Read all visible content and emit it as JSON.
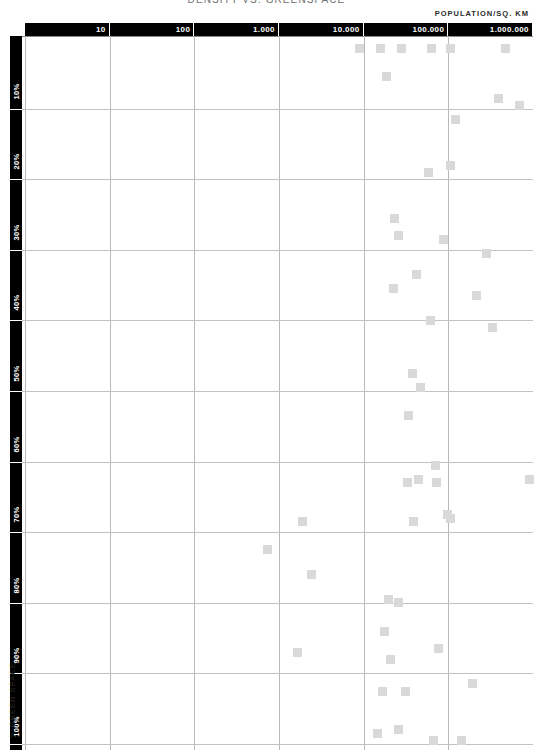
{
  "title": "DENSITY VS. GREENSPACE",
  "x_axis": {
    "caption": "POPULATION/SQ. KM",
    "ticks": [
      "10",
      "100",
      "1.000",
      "10.000",
      "100.000",
      "1.000.000"
    ]
  },
  "y_axis": {
    "caption": "% GREEN SPACE",
    "ticks": [
      "10%",
      "20%",
      "30%",
      "40%",
      "50%",
      "60%",
      "70%",
      "80%",
      "90%",
      "100%"
    ]
  },
  "colors": {
    "axis_bar": "#000000",
    "axis_text": "#ffffff",
    "gridline": "#bcbcbc",
    "marker": "#d9d9d9",
    "title": "#6f6f6f"
  },
  "chart_data": {
    "type": "scatter",
    "title": "DENSITY VS. GREENSPACE",
    "xlabel": "POPULATION/SQ. KM",
    "ylabel": "% GREEN SPACE",
    "xscale": "log",
    "xlim": [
      1,
      3000000
    ],
    "ylim": [
      0,
      100
    ],
    "xticks": [
      10,
      100,
      1000,
      10000,
      100000,
      1000000
    ],
    "yticks": [
      10,
      20,
      30,
      40,
      50,
      60,
      70,
      80,
      90,
      100
    ],
    "grid": true,
    "legend": "none",
    "marker": "square",
    "points": [
      {
        "density": 8900,
        "green": 1.5
      },
      {
        "density": 16000,
        "green": 1.5
      },
      {
        "density": 28000,
        "green": 1.5
      },
      {
        "density": 63000,
        "green": 1.5
      },
      {
        "density": 105000,
        "green": 1.5
      },
      {
        "density": 470000,
        "green": 1.5
      },
      {
        "density": 18500,
        "green": 5.5
      },
      {
        "density": 390000,
        "green": 8.5
      },
      {
        "density": 690000,
        "green": 9.5
      },
      {
        "density": 120000,
        "green": 11.5
      },
      {
        "density": 58000,
        "green": 19.0
      },
      {
        "density": 105000,
        "green": 18.0
      },
      {
        "density": 23000,
        "green": 25.5
      },
      {
        "density": 25500,
        "green": 28.0
      },
      {
        "density": 88000,
        "green": 28.5
      },
      {
        "density": 280000,
        "green": 30.5
      },
      {
        "density": 42000,
        "green": 33.5
      },
      {
        "density": 22500,
        "green": 35.5
      },
      {
        "density": 215000,
        "green": 36.5
      },
      {
        "density": 62000,
        "green": 40.0
      },
      {
        "density": 330000,
        "green": 41.0
      },
      {
        "density": 38000,
        "green": 47.5
      },
      {
        "density": 47000,
        "green": 49.5
      },
      {
        "density": 34000,
        "green": 53.5
      },
      {
        "density": 33000,
        "green": 63.0
      },
      {
        "density": 44000,
        "green": 62.5
      },
      {
        "density": 70000,
        "green": 60.5
      },
      {
        "density": 72000,
        "green": 63.0
      },
      {
        "density": 900000,
        "green": 62.5
      },
      {
        "density": 1900,
        "green": 68.5
      },
      {
        "density": 39000,
        "green": 68.5
      },
      {
        "density": 98000,
        "green": 67.5
      },
      {
        "density": 105000,
        "green": 68.0
      },
      {
        "density": 730,
        "green": 72.5
      },
      {
        "density": 2400,
        "green": 76.0
      },
      {
        "density": 19500,
        "green": 79.5
      },
      {
        "density": 25500,
        "green": 80.0
      },
      {
        "density": 17500,
        "green": 84.0
      },
      {
        "density": 1650,
        "green": 87.0
      },
      {
        "density": 20500,
        "green": 88.0
      },
      {
        "density": 77000,
        "green": 86.5
      },
      {
        "density": 16500,
        "green": 92.5
      },
      {
        "density": 31000,
        "green": 92.5
      },
      {
        "density": 195000,
        "green": 91.5
      },
      {
        "density": 14500,
        "green": 98.5
      },
      {
        "density": 26000,
        "green": 98.0
      },
      {
        "density": 66000,
        "green": 99.5
      },
      {
        "density": 145000,
        "green": 99.5
      }
    ]
  }
}
